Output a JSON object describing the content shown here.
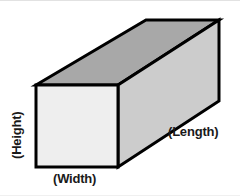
{
  "diagram": {
    "type": "3d-rectangular-prism",
    "labels": {
      "height": "(Height)",
      "width": "(Width)",
      "length": "(Length)"
    },
    "colors": {
      "front_face": "#eeeeee",
      "side_face": "#cccccc",
      "top_face": "#a8a8a8",
      "outline": "#000000",
      "background": "#ffffff",
      "text": "#1a1a1a"
    },
    "geometry": {
      "front_face_points": "36,84 118,84 118,166 36,166",
      "top_face_points": "36,84 146,19 219,19 118,84",
      "side_face_points": "118,84 219,19 219,100 118,166"
    }
  }
}
